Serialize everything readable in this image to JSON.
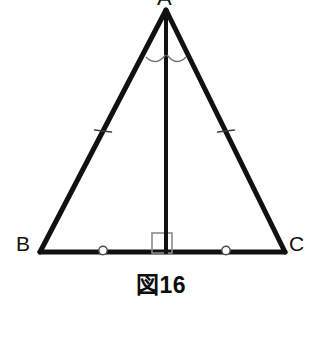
{
  "figure": {
    "caption": "図16",
    "background_color": "#ffffff",
    "stroke_color": "#111111",
    "mark_color": "#6b6b6b"
  },
  "vertices": {
    "a": {
      "label": "A",
      "x": 166,
      "y": 10
    },
    "b": {
      "label": "B",
      "x": 40,
      "y": 252
    },
    "c": {
      "label": "C",
      "x": 285,
      "y": 252
    },
    "d": {
      "label": "",
      "x": 166,
      "y": 252
    }
  },
  "segments": [
    {
      "name": "side-ab",
      "from": "A",
      "to": "B",
      "x1": 166,
      "y1": 10,
      "x2": 40,
      "y2": 252,
      "width": 5
    },
    {
      "name": "side-ac",
      "from": "A",
      "to": "C",
      "x1": 166,
      "y1": 10,
      "x2": 285,
      "y2": 252,
      "width": 5
    },
    {
      "name": "side-bc",
      "from": "B",
      "to": "C",
      "x1": 40,
      "y1": 252,
      "x2": 285,
      "y2": 252,
      "width": 5
    },
    {
      "name": "altitude-ad",
      "from": "A",
      "to": "D",
      "x1": 166,
      "y1": 10,
      "x2": 166,
      "y2": 254,
      "width": 4
    }
  ],
  "marks": {
    "angle_arcs": [
      {
        "name": "angle-arc-bad",
        "path": "M 147 59 Q 156 66 165 56",
        "color": "#777777"
      },
      {
        "name": "angle-arc-dac",
        "path": "M 167 56 Q 176 66 185 58",
        "color": "#777777"
      }
    ],
    "side_ticks": [
      {
        "name": "tick-side-ab",
        "cx": 103,
        "cy": 131,
        "angle": -62,
        "color": "#3a3a3a"
      },
      {
        "name": "tick-side-ac",
        "cx": 226,
        "cy": 131,
        "angle": 64,
        "color": "#3a3a3a"
      }
    ],
    "base_circles": [
      {
        "name": "circle-mark-bd",
        "cx": 103,
        "cy": 250,
        "r": 4.2,
        "color": "#4a4a4a"
      },
      {
        "name": "circle-mark-dc",
        "cx": 226,
        "cy": 250,
        "r": 4.2,
        "color": "#4a4a4a"
      }
    ],
    "right_angle": {
      "name": "right-angle-square",
      "x": 152,
      "y": 233,
      "size": 20,
      "color": "#8a8a8a"
    }
  }
}
